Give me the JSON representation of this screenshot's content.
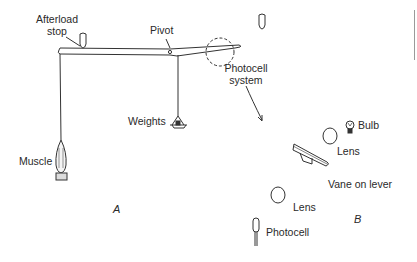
{
  "diagram": {
    "panels": {
      "a_label": "A",
      "b_label": "B"
    },
    "labels": {
      "afterload_stop_line1": "Afterload",
      "afterload_stop_line2": "stop",
      "pivot": "Pivot",
      "photocell_system_line1": "Photocell",
      "photocell_system_line2": "system",
      "weights": "Weights",
      "muscle": "Muscle",
      "bulb": "Bulb",
      "lens_upper": "Lens",
      "vane_on_lever": "Vane on lever",
      "lens_lower": "Lens",
      "photocell": "Photocell"
    },
    "colors": {
      "stroke": "#333333",
      "text": "#2a2a2a",
      "background": "#ffffff"
    }
  }
}
